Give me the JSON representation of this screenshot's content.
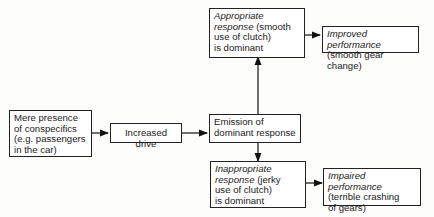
{
  "nodes": {
    "presence": {
      "line1": "Mere presence",
      "line2": "of conspecifics",
      "line3": "(e.g. passengers",
      "line4": "in the car)"
    },
    "drive": {
      "label": "Increased drive"
    },
    "emission": {
      "line1": "Emission of",
      "line2": "dominant response"
    },
    "appropriate": {
      "italic1": "Appropriate",
      "italic2": "response",
      "rest2": " (smooth",
      "line3": "use of clutch)",
      "line4": "is dominant"
    },
    "improved": {
      "italic": "Improved performance",
      "line2": "(smooth gear change)"
    },
    "inappropriate": {
      "italic1": "Inappropriate",
      "italic2": "response",
      "rest2": " (jerky",
      "line3": "use of clutch)",
      "line4": "is dominant"
    },
    "impaired": {
      "italic": "Impaired performance",
      "line2": "(terrible crashing",
      "line3": "of gears)"
    }
  }
}
